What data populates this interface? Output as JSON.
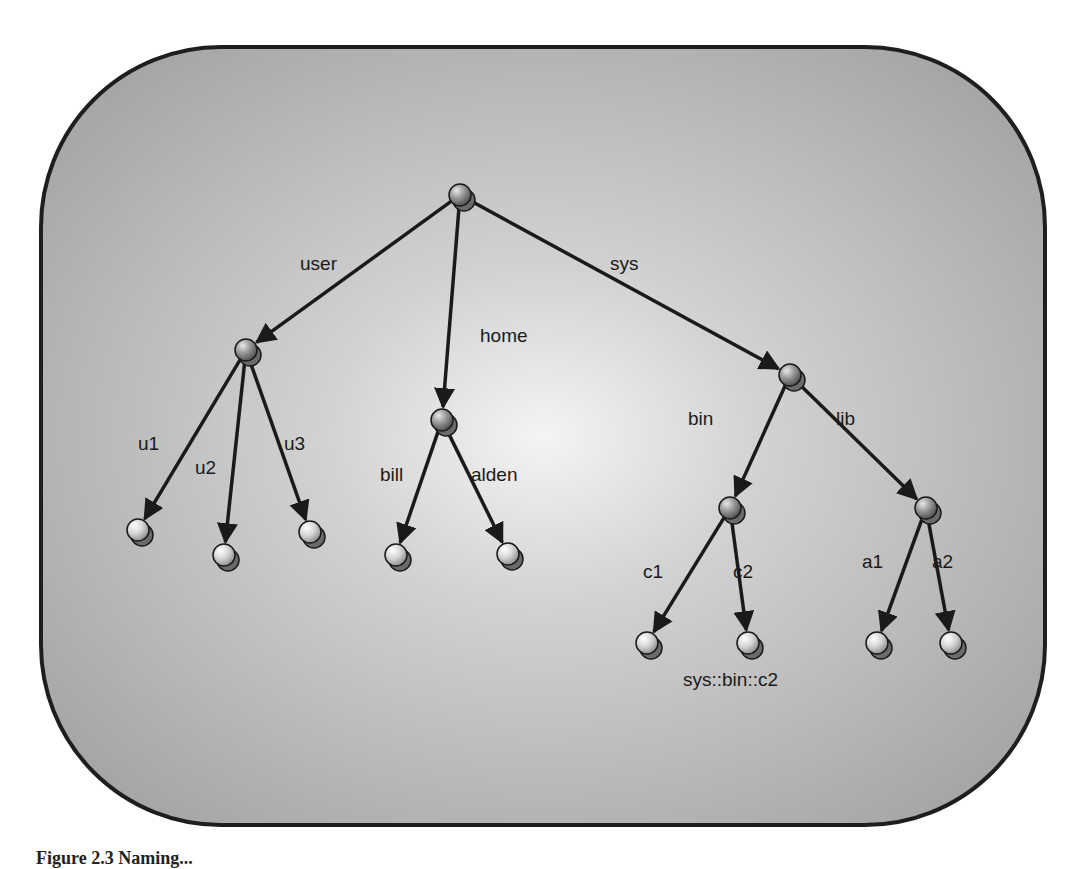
{
  "figure": {
    "frame": {
      "x": 41,
      "y": 47,
      "width": 1004,
      "height": 778,
      "radius": 180,
      "fill_center": "#f4f4f4",
      "fill_edge": "#a8a8a8",
      "stroke": "#1e1e1e"
    },
    "caption": "Figure 2.3   Naming..."
  },
  "tree": {
    "nodes": [
      {
        "id": "root",
        "x": 460,
        "y": 195,
        "kind": "internal"
      },
      {
        "id": "user",
        "x": 246,
        "y": 350,
        "kind": "internal"
      },
      {
        "id": "home",
        "x": 442,
        "y": 420,
        "kind": "internal"
      },
      {
        "id": "sys",
        "x": 790,
        "y": 375,
        "kind": "internal"
      },
      {
        "id": "u1",
        "x": 138,
        "y": 530,
        "kind": "leaf"
      },
      {
        "id": "u2",
        "x": 224,
        "y": 555,
        "kind": "leaf"
      },
      {
        "id": "u3",
        "x": 310,
        "y": 532,
        "kind": "leaf"
      },
      {
        "id": "bill",
        "x": 396,
        "y": 555,
        "kind": "leaf"
      },
      {
        "id": "alden",
        "x": 508,
        "y": 554,
        "kind": "leaf"
      },
      {
        "id": "bin",
        "x": 730,
        "y": 508,
        "kind": "internal"
      },
      {
        "id": "lib",
        "x": 926,
        "y": 508,
        "kind": "internal"
      },
      {
        "id": "c1",
        "x": 647,
        "y": 643,
        "kind": "leaf"
      },
      {
        "id": "c2",
        "x": 748,
        "y": 643,
        "kind": "leaf"
      },
      {
        "id": "a1",
        "x": 877,
        "y": 643,
        "kind": "leaf"
      },
      {
        "id": "a2",
        "x": 951,
        "y": 643,
        "kind": "leaf"
      }
    ],
    "edges": [
      {
        "from": "root",
        "to": "user",
        "label": "user",
        "lx": 300,
        "ly": 270
      },
      {
        "from": "root",
        "to": "home",
        "label": "home",
        "lx": 480,
        "ly": 342
      },
      {
        "from": "root",
        "to": "sys",
        "label": "sys",
        "lx": 610,
        "ly": 270
      },
      {
        "from": "user",
        "to": "u1",
        "label": "u1",
        "lx": 138,
        "ly": 450
      },
      {
        "from": "user",
        "to": "u2",
        "label": "u2",
        "lx": 195,
        "ly": 474
      },
      {
        "from": "user",
        "to": "u3",
        "label": "u3",
        "lx": 284,
        "ly": 450
      },
      {
        "from": "home",
        "to": "bill",
        "label": "bill",
        "lx": 380,
        "ly": 481
      },
      {
        "from": "home",
        "to": "alden",
        "label": "alden",
        "lx": 471,
        "ly": 481
      },
      {
        "from": "sys",
        "to": "bin",
        "label": "bin",
        "lx": 688,
        "ly": 425
      },
      {
        "from": "sys",
        "to": "lib",
        "label": "lib",
        "lx": 836,
        "ly": 425
      },
      {
        "from": "bin",
        "to": "c1",
        "label": "c1",
        "lx": 643,
        "ly": 578
      },
      {
        "from": "bin",
        "to": "c2",
        "label": "c2",
        "lx": 733,
        "ly": 578
      },
      {
        "from": "lib",
        "to": "a1",
        "label": "a1",
        "lx": 862,
        "ly": 568
      },
      {
        "from": "lib",
        "to": "a2",
        "label": "a2",
        "lx": 932,
        "ly": 568
      }
    ],
    "path_label": {
      "text": "sys::bin::c2",
      "x": 683,
      "y": 686
    }
  }
}
